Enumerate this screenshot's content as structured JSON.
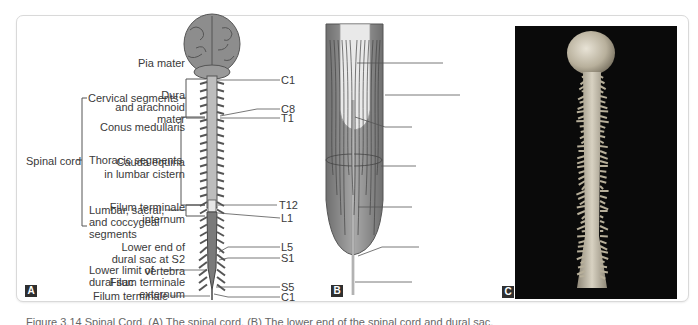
{
  "panel_a": {
    "badge": "A",
    "left_labels": {
      "spinal_cord": "Spinal cord",
      "cervical": "Cervical segments",
      "thoracic": "Thoracic segments",
      "lumbar_line1": "Lumbar, sacral,",
      "lumbar_line2": "and coccygeal",
      "lumbar_line3": "segments",
      "lower_limit_line1": "Lower limit of",
      "lower_limit_line2": "dural sac",
      "filum": "Filum terminale"
    },
    "right_labels": [
      "C1",
      "C8",
      "T1",
      "T12",
      "L1",
      "L5",
      "S1",
      "S5",
      "C1"
    ]
  },
  "panel_b": {
    "badge": "B",
    "labels": {
      "pia": "Pia mater",
      "dura_line1": "Dura",
      "dura_line2": "and arachnoid",
      "dura_line3": "mater",
      "conus": "Conus medullaris",
      "cauda_line1": "Cauda equina",
      "cauda_line2": "in lumbar cistern",
      "fti_line1": "Filum terminale",
      "fti_line2": "internum",
      "lower_end_line1": "Lower end of",
      "lower_end_line2": "dural sac at S2",
      "lower_end_line3": "vertebra",
      "fte_line1": "Filum terminale",
      "fte_line2": "externum"
    }
  },
  "panel_c": {
    "badge": "C"
  },
  "caption": "Figure 3.14  Spinal Cord. (A) The spinal cord. (B) The lower end of the spinal cord and dural sac."
}
